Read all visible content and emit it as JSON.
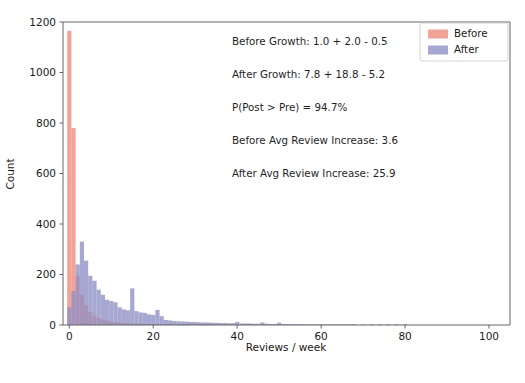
{
  "chart_data": {
    "type": "bar",
    "subtype": "overlaid-histogram",
    "title": "",
    "xlabel": "Reviews / week",
    "ylabel": "Count",
    "xlim": [
      -1.5,
      105
    ],
    "ylim": [
      0,
      1200
    ],
    "xticks": [
      0,
      20,
      40,
      60,
      80,
      100
    ],
    "yticks": [
      0,
      200,
      400,
      600,
      800,
      1000,
      1200
    ],
    "grid": false,
    "bin_width": 1,
    "legend_position": "upper right",
    "colors": {
      "before": "#f08878",
      "after": "#8d8fc4",
      "overlap": "#8a5c80",
      "axis": "#555555",
      "text": "#1a1a1a",
      "background": "#ffffff"
    },
    "series": [
      {
        "name": "Before",
        "color": "#f08878",
        "x": [
          0,
          1,
          2,
          3,
          4,
          5,
          6,
          7,
          8,
          9,
          10,
          11,
          12,
          13,
          14,
          15,
          16,
          17,
          18,
          19,
          20,
          21,
          22,
          23,
          24,
          25,
          26,
          27,
          28,
          29,
          30,
          31,
          32,
          33,
          34,
          35,
          36,
          37,
          38,
          39,
          40,
          42,
          44,
          46,
          48,
          50,
          55,
          60
        ],
        "values": [
          1165,
          780,
          195,
          120,
          78,
          52,
          38,
          28,
          22,
          17,
          14,
          11,
          9,
          8,
          7,
          6,
          5,
          5,
          4,
          4,
          3,
          3,
          3,
          2,
          2,
          2,
          2,
          1,
          1,
          1,
          1,
          1,
          1,
          1,
          1,
          0,
          0,
          0,
          0,
          0,
          0,
          0,
          0,
          0,
          0,
          0,
          0,
          0
        ]
      },
      {
        "name": "After",
        "color": "#8d8fc4",
        "x": [
          0,
          1,
          2,
          3,
          4,
          5,
          6,
          7,
          8,
          9,
          10,
          11,
          12,
          13,
          14,
          15,
          16,
          17,
          18,
          19,
          20,
          21,
          22,
          23,
          24,
          25,
          26,
          27,
          28,
          29,
          30,
          31,
          32,
          33,
          34,
          35,
          36,
          37,
          38,
          39,
          40,
          41,
          42,
          43,
          44,
          45,
          46,
          47,
          48,
          49,
          50,
          51,
          52,
          53,
          54,
          55,
          56,
          57,
          58,
          59,
          60,
          61,
          62,
          63,
          64,
          65,
          66,
          67,
          68,
          70,
          72,
          74,
          76,
          78,
          80,
          82,
          85,
          88,
          90,
          95,
          100
        ],
        "values": [
          70,
          135,
          240,
          330,
          255,
          195,
          175,
          140,
          120,
          100,
          95,
          90,
          70,
          62,
          58,
          145,
          55,
          50,
          48,
          42,
          40,
          60,
          35,
          20,
          18,
          16,
          15,
          14,
          13,
          12,
          12,
          11,
          10,
          10,
          9,
          9,
          8,
          8,
          7,
          7,
          12,
          6,
          6,
          6,
          5,
          5,
          10,
          5,
          4,
          4,
          9,
          4,
          4,
          3,
          3,
          3,
          3,
          3,
          2,
          2,
          2,
          2,
          2,
          2,
          1,
          1,
          1,
          1,
          1,
          1,
          1,
          1,
          1,
          1,
          1,
          0,
          0,
          0,
          0,
          0,
          0
        ]
      }
    ],
    "annotations": [
      "Before Growth: 1.0 + 2.0 - 0.5",
      "After Growth:  7.8 + 18.8 - 5.2",
      "P(Post > Pre) = 94.7%",
      "Before Avg Review Increase: 3.6",
      "After Avg Review Increase: 25.9"
    ],
    "legend": [
      {
        "label": "Before",
        "color": "#f08878"
      },
      {
        "label": "After",
        "color": "#8d8fc4"
      }
    ]
  }
}
